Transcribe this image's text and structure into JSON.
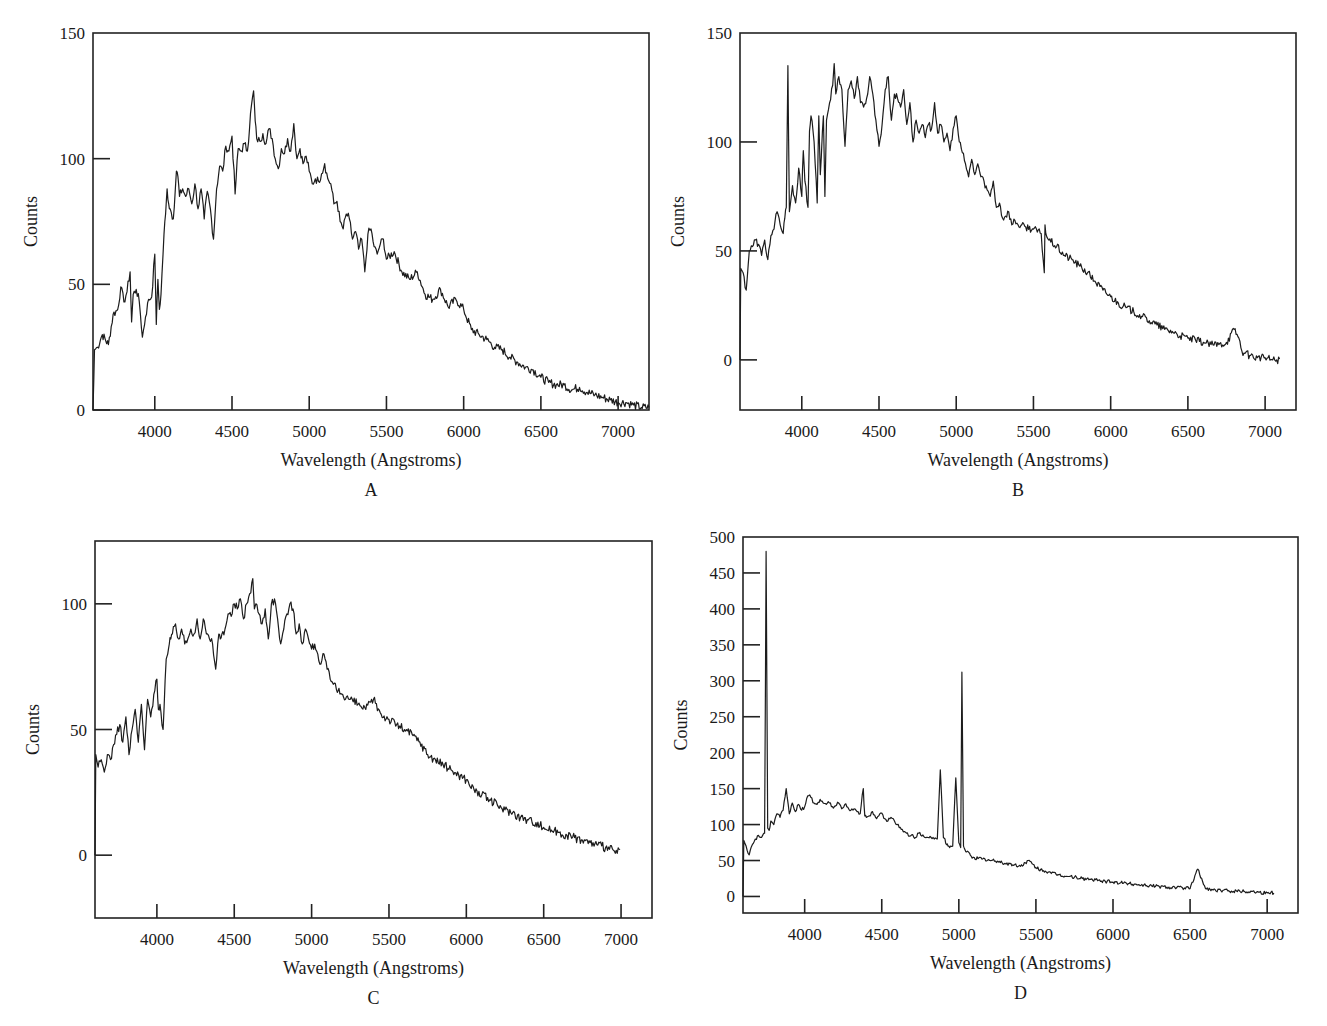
{
  "figure": {
    "x_axis_label": "Wavelength (Angstroms)",
    "y_axis_label": "Counts",
    "line_color": "#1c1c1c",
    "background": "#ffffff"
  },
  "chart_data": [
    {
      "id": "A",
      "panel_label": "A",
      "type": "line",
      "title": "",
      "xlabel": "Wavelength (Angstroms)",
      "ylabel": "Counts",
      "xlim": [
        3600,
        7200
      ],
      "ylim": [
        0,
        150
      ],
      "xticks": [
        4000,
        4500,
        5000,
        5500,
        6000,
        6500,
        7000
      ],
      "yticks": [
        0,
        50,
        100,
        150
      ],
      "grid": false,
      "frame_px": {
        "left": 93,
        "top": 33,
        "right": 649,
        "bottom": 410
      },
      "x": [
        3600,
        3610,
        3630,
        3660,
        3700,
        3730,
        3760,
        3780,
        3800,
        3820,
        3840,
        3850,
        3860,
        3880,
        3900,
        3920,
        3940,
        3960,
        3980,
        4000,
        4010,
        4020,
        4030,
        4040,
        4060,
        4070,
        4080,
        4090,
        4100,
        4120,
        4140,
        4150,
        4160,
        4180,
        4200,
        4220,
        4240,
        4260,
        4280,
        4300,
        4320,
        4340,
        4360,
        4380,
        4400,
        4420,
        4440,
        4460,
        4480,
        4500,
        4520,
        4540,
        4560,
        4580,
        4600,
        4620,
        4640,
        4650,
        4660,
        4680,
        4700,
        4720,
        4740,
        4760,
        4780,
        4800,
        4820,
        4840,
        4860,
        4880,
        4900,
        4920,
        4940,
        4960,
        4980,
        5000,
        5020,
        5040,
        5060,
        5080,
        5100,
        5120,
        5140,
        5160,
        5180,
        5200,
        5220,
        5240,
        5260,
        5280,
        5300,
        5320,
        5340,
        5360,
        5380,
        5400,
        5420,
        5440,
        5460,
        5480,
        5500,
        5550,
        5600,
        5650,
        5700,
        5750,
        5800,
        5850,
        5900,
        5950,
        6000,
        6050,
        6100,
        6150,
        6200,
        6250,
        6300,
        6350,
        6400,
        6450,
        6500,
        6550,
        6600,
        6650,
        6700,
        6750,
        6800,
        6850,
        6900,
        6950,
        7000,
        7050,
        7100,
        7150,
        7200
      ],
      "values": [
        0,
        24,
        25,
        30,
        26,
        38,
        40,
        49,
        43,
        47,
        55,
        35,
        46,
        48,
        43,
        29,
        37,
        44,
        45,
        62,
        34,
        52,
        40,
        46,
        70,
        78,
        88,
        82,
        80,
        76,
        95,
        93,
        85,
        88,
        85,
        88,
        82,
        90,
        80,
        88,
        76,
        87,
        80,
        68,
        88,
        97,
        95,
        105,
        103,
        109,
        86,
        104,
        103,
        106,
        103,
        118,
        127,
        115,
        108,
        107,
        110,
        106,
        112,
        108,
        100,
        96,
        104,
        102,
        108,
        103,
        114,
        100,
        104,
        98,
        101,
        95,
        90,
        92,
        91,
        94,
        98,
        92,
        90,
        82,
        83,
        75,
        72,
        78,
        76,
        68,
        71,
        64,
        68,
        55,
        70,
        72,
        65,
        62,
        66,
        68,
        60,
        63,
        55,
        52,
        55,
        46,
        44,
        48,
        41,
        44,
        40,
        32,
        30,
        28,
        25,
        24,
        21,
        19,
        17,
        16,
        13,
        11,
        10,
        10,
        8,
        9,
        7,
        6,
        5,
        4,
        3,
        3,
        2,
        1,
        1
      ],
      "annotations": []
    },
    {
      "id": "B",
      "panel_label": "B",
      "type": "line",
      "title": "",
      "xlabel": "Wavelength (Angstroms)",
      "ylabel": "Counts",
      "xlim": [
        3600,
        7200
      ],
      "ylim": [
        -23,
        150
      ],
      "xticks": [
        4000,
        4500,
        5000,
        5500,
        6000,
        6500,
        7000
      ],
      "yticks": [
        0,
        50,
        100,
        150
      ],
      "grid": false,
      "frame_px": {
        "left": 740,
        "top": 33,
        "right": 1296,
        "bottom": 410
      },
      "x": [
        3600,
        3605,
        3620,
        3640,
        3660,
        3680,
        3700,
        3720,
        3740,
        3760,
        3780,
        3800,
        3820,
        3840,
        3860,
        3880,
        3890,
        3900,
        3910,
        3920,
        3940,
        3960,
        3980,
        4000,
        4010,
        4020,
        4040,
        4050,
        4060,
        4080,
        4100,
        4110,
        4120,
        4140,
        4150,
        4160,
        4180,
        4200,
        4210,
        4220,
        4240,
        4260,
        4280,
        4300,
        4320,
        4340,
        4360,
        4380,
        4400,
        4420,
        4440,
        4460,
        4480,
        4500,
        4520,
        4540,
        4560,
        4580,
        4600,
        4620,
        4640,
        4660,
        4680,
        4700,
        4720,
        4740,
        4760,
        4780,
        4800,
        4820,
        4840,
        4860,
        4880,
        4900,
        4920,
        4940,
        4960,
        4980,
        5000,
        5020,
        5040,
        5060,
        5080,
        5100,
        5120,
        5140,
        5160,
        5180,
        5200,
        5220,
        5240,
        5260,
        5280,
        5300,
        5320,
        5340,
        5360,
        5380,
        5400,
        5450,
        5500,
        5550,
        5570,
        5575,
        5580,
        5600,
        5650,
        5700,
        5750,
        5800,
        5850,
        5900,
        5950,
        6000,
        6050,
        6100,
        6150,
        6200,
        6250,
        6300,
        6350,
        6400,
        6450,
        6500,
        6550,
        6600,
        6650,
        6700,
        6750,
        6800,
        6830,
        6850,
        6870,
        6900,
        6950,
        7000,
        7050,
        7100,
        7150,
        7200
      ],
      "values": [
        0,
        42,
        40,
        32,
        50,
        52,
        55,
        53,
        48,
        55,
        46,
        57,
        60,
        68,
        62,
        58,
        65,
        70,
        135,
        68,
        80,
        72,
        88,
        75,
        96,
        82,
        70,
        105,
        112,
        100,
        72,
        112,
        85,
        112,
        75,
        110,
        118,
        126,
        136,
        122,
        130,
        124,
        98,
        124,
        128,
        120,
        130,
        118,
        116,
        120,
        130,
        122,
        110,
        98,
        108,
        124,
        130,
        110,
        122,
        120,
        116,
        124,
        108,
        118,
        100,
        110,
        104,
        108,
        102,
        108,
        106,
        118,
        104,
        108,
        100,
        104,
        96,
        106,
        112,
        100,
        95,
        90,
        84,
        92,
        85,
        90,
        84,
        82,
        78,
        75,
        82,
        70,
        72,
        65,
        66,
        68,
        62,
        64,
        62,
        61,
        60,
        58,
        40,
        62,
        58,
        55,
        52,
        48,
        46,
        43,
        40,
        36,
        32,
        29,
        26,
        24,
        22,
        20,
        18,
        16,
        14,
        13,
        11,
        10,
        9,
        8,
        7,
        7,
        8,
        14,
        10,
        4,
        3,
        2,
        1,
        1,
        0,
        0
      ],
      "annotations": []
    },
    {
      "id": "C",
      "panel_label": "C",
      "type": "line",
      "title": "",
      "xlabel": "Wavelength (Angstroms)",
      "ylabel": "Counts",
      "xlim": [
        3600,
        7200
      ],
      "ylim": [
        -25,
        125
      ],
      "xticks": [
        4000,
        4500,
        5000,
        5500,
        6000,
        6500,
        7000
      ],
      "yticks": [
        0,
        50,
        100
      ],
      "grid": false,
      "frame_px": {
        "left": 95,
        "top": 541,
        "right": 652,
        "bottom": 918
      },
      "x": [
        3600,
        3605,
        3620,
        3640,
        3660,
        3680,
        3700,
        3720,
        3740,
        3760,
        3780,
        3800,
        3820,
        3840,
        3860,
        3880,
        3900,
        3920,
        3940,
        3960,
        3980,
        4000,
        4010,
        4020,
        4040,
        4060,
        4070,
        4080,
        4090,
        4100,
        4120,
        4140,
        4160,
        4180,
        4200,
        4220,
        4240,
        4260,
        4280,
        4300,
        4320,
        4340,
        4360,
        4380,
        4400,
        4410,
        4420,
        4440,
        4460,
        4480,
        4500,
        4520,
        4540,
        4560,
        4580,
        4600,
        4620,
        4630,
        4640,
        4660,
        4680,
        4700,
        4720,
        4740,
        4760,
        4780,
        4800,
        4820,
        4840,
        4860,
        4880,
        4900,
        4920,
        4940,
        4960,
        4980,
        5000,
        5020,
        5040,
        5060,
        5080,
        5100,
        5120,
        5140,
        5160,
        5200,
        5250,
        5300,
        5350,
        5400,
        5450,
        5500,
        5550,
        5600,
        5650,
        5700,
        5750,
        5800,
        5850,
        5900,
        5950,
        6000,
        6050,
        6100,
        6150,
        6200,
        6250,
        6300,
        6350,
        6400,
        6450,
        6500,
        6550,
        6600,
        6650,
        6700,
        6750,
        6800,
        6850,
        6900,
        6950,
        7000,
        7050,
        7100,
        7150,
        7200
      ],
      "values": [
        0,
        40,
        35,
        38,
        33,
        40,
        38,
        44,
        48,
        52,
        45,
        55,
        40,
        50,
        58,
        45,
        60,
        42,
        62,
        55,
        64,
        70,
        58,
        60,
        50,
        78,
        80,
        84,
        86,
        88,
        92,
        86,
        90,
        84,
        86,
        90,
        88,
        94,
        86,
        94,
        88,
        86,
        84,
        74,
        88,
        86,
        88,
        90,
        96,
        95,
        100,
        98,
        102,
        94,
        100,
        104,
        110,
        98,
        100,
        96,
        92,
        98,
        86,
        100,
        102,
        94,
        84,
        90,
        96,
        100,
        98,
        88,
        92,
        84,
        90,
        86,
        82,
        84,
        80,
        76,
        80,
        74,
        70,
        68,
        66,
        64,
        62,
        60,
        58,
        62,
        56,
        54,
        52,
        50,
        48,
        45,
        40,
        38,
        36,
        34,
        32,
        30,
        26,
        24,
        22,
        20,
        18,
        17,
        15,
        14,
        13,
        11,
        10,
        9,
        8,
        7,
        6,
        5,
        4,
        3,
        2,
        1
      ],
      "annotations": []
    },
    {
      "id": "D",
      "panel_label": "D",
      "type": "line",
      "title": "",
      "xlabel": "Wavelength (Angstroms)",
      "ylabel": "Counts",
      "xlim": [
        3600,
        7200
      ],
      "ylim": [
        -23,
        500
      ],
      "xticks": [
        4000,
        4500,
        5000,
        5500,
        6000,
        6500,
        7000
      ],
      "yticks": [
        0,
        50,
        100,
        150,
        200,
        250,
        300,
        350,
        400,
        450,
        500
      ],
      "grid": false,
      "frame_px": {
        "left": 743,
        "top": 537,
        "right": 1298,
        "bottom": 913
      },
      "x": [
        3600,
        3605,
        3620,
        3640,
        3660,
        3680,
        3700,
        3720,
        3740,
        3750,
        3760,
        3770,
        3780,
        3800,
        3820,
        3840,
        3860,
        3880,
        3900,
        3920,
        3940,
        3960,
        3980,
        4000,
        4020,
        4040,
        4060,
        4080,
        4100,
        4120,
        4140,
        4160,
        4180,
        4200,
        4220,
        4240,
        4260,
        4280,
        4300,
        4320,
        4340,
        4360,
        4380,
        4390,
        4400,
        4420,
        4440,
        4460,
        4480,
        4500,
        4520,
        4540,
        4560,
        4580,
        4600,
        4620,
        4640,
        4660,
        4680,
        4700,
        4720,
        4740,
        4760,
        4780,
        4800,
        4820,
        4840,
        4860,
        4880,
        4900,
        4910,
        4920,
        4930,
        4940,
        4960,
        4980,
        5000,
        5006,
        5012,
        5020,
        5030,
        5040,
        5050,
        5056,
        5062,
        5070,
        5080,
        5100,
        5150,
        5200,
        5250,
        5300,
        5350,
        5400,
        5450,
        5500,
        5550,
        5580,
        5600,
        5650,
        5700,
        5750,
        5800,
        5850,
        5900,
        5950,
        6000,
        6050,
        6100,
        6150,
        6200,
        6250,
        6300,
        6350,
        6400,
        6450,
        6500,
        6550,
        6600,
        6630,
        6640,
        6650,
        6700,
        6750,
        6800,
        6850,
        6900,
        6950,
        7000,
        7050,
        7100,
        7150,
        7200
      ],
      "values": [
        0,
        78,
        70,
        58,
        72,
        80,
        85,
        82,
        88,
        480,
        95,
        92,
        105,
        100,
        115,
        110,
        120,
        150,
        115,
        130,
        118,
        128,
        120,
        125,
        140,
        138,
        130,
        128,
        135,
        130,
        128,
        130,
        125,
        126,
        130,
        122,
        128,
        124,
        120,
        122,
        118,
        115,
        150,
        112,
        110,
        112,
        118,
        110,
        112,
        116,
        108,
        105,
        110,
        106,
        100,
        96,
        90,
        88,
        84,
        86,
        82,
        88,
        84,
        82,
        82,
        82,
        80,
        80,
        176,
        82,
        80,
        72,
        70,
        68,
        70,
        165,
        75,
        72,
        68,
        312,
        70,
        65,
        62,
        63,
        62,
        60,
        56,
        54,
        52,
        50,
        49,
        46,
        44,
        42,
        50,
        40,
        36,
        34,
        32,
        30,
        28,
        27,
        25,
        24,
        22,
        21,
        20,
        19,
        18,
        17,
        16,
        15,
        14,
        13,
        13,
        12,
        11,
        38,
        11,
        10,
        10,
        9,
        8,
        8,
        8,
        7,
        7,
        6,
        5,
        5
      ],
      "annotations": [
        "strong emission line near 3727 A (~480 counts)",
        "emission near 4861 A (~175)",
        "emission lines near 4959 A (~165) and 5007 A (~312)",
        "emission near 6563 A (~38)"
      ]
    }
  ],
  "caption_fragment": ""
}
